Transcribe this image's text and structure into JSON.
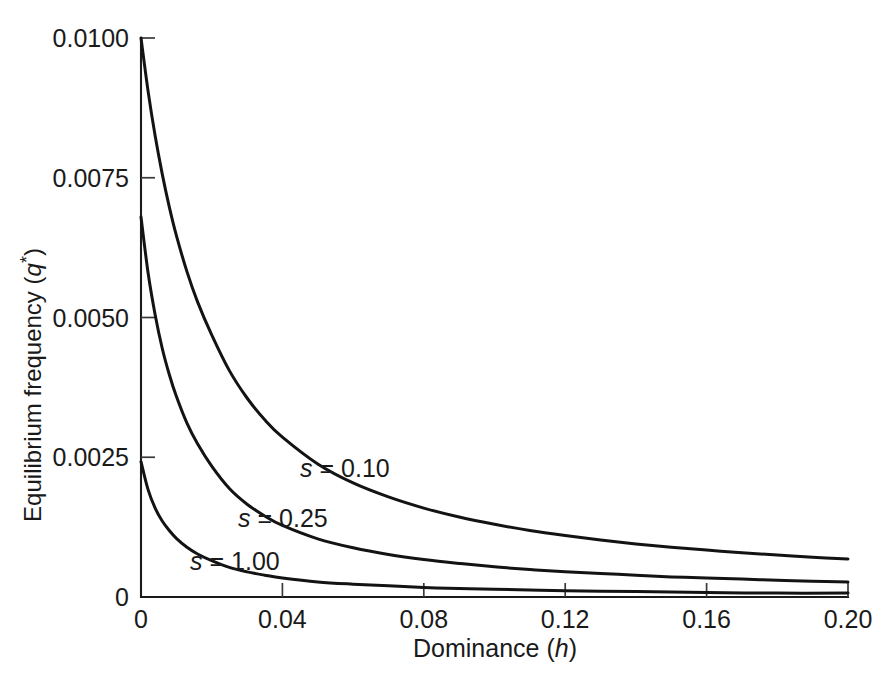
{
  "chart_data": {
    "type": "line",
    "title": "",
    "subtitle": "",
    "xlabel": "Dominance (h)",
    "xlabel_text": "Dominance (",
    "xlabel_var": "h",
    "xlabel_tail": ")",
    "ylabel": "Equilibrium frequency (q*)",
    "ylabel_text": "Equilibrium frequency (",
    "ylabel_var": "q",
    "ylabel_sup": "*",
    "ylabel_tail": ")",
    "xlim": [
      0,
      0.2
    ],
    "ylim": [
      0,
      0.01
    ],
    "grid": false,
    "legend_position": "inline-annotations",
    "xticks": [
      0,
      0.04,
      0.08,
      0.12,
      0.16,
      0.2
    ],
    "xtick_labels": [
      "0",
      "0.04",
      "0.08",
      "0.12",
      "0.16",
      "0.20"
    ],
    "yticks": [
      0,
      0.0025,
      0.005,
      0.0075,
      0.01
    ],
    "ytick_labels": [
      "0",
      "0.0025",
      "0.0050",
      "0.0075",
      "0.0100"
    ],
    "series": [
      {
        "name": "s = 0.10",
        "label_var": "s",
        "label_value": "= 0.10",
        "s": 0.1,
        "x": [
          0.0,
          0.002,
          0.004,
          0.006,
          0.008,
          0.01,
          0.013,
          0.016,
          0.02,
          0.025,
          0.03,
          0.035,
          0.04,
          0.05,
          0.06,
          0.07,
          0.08,
          0.09,
          0.1,
          0.11,
          0.12,
          0.13,
          0.14,
          0.15,
          0.16,
          0.17,
          0.18,
          0.19,
          0.2
        ],
        "y": [
          0.01,
          0.00905,
          0.00825,
          0.00757,
          0.00698,
          0.00647,
          0.00582,
          0.00528,
          0.00469,
          0.00405,
          0.00356,
          0.00317,
          0.00286,
          0.00238,
          0.00204,
          0.00179,
          0.00159,
          0.00143,
          0.0013,
          0.00119,
          0.0011,
          0.00102,
          0.00095,
          0.00089,
          0.00084,
          0.00079,
          0.00075,
          0.00071,
          0.00068
        ]
      },
      {
        "name": "s = 0.25",
        "label_var": "s",
        "label_value": "= 0.25",
        "s": 0.25,
        "x": [
          0.0,
          0.002,
          0.004,
          0.006,
          0.008,
          0.01,
          0.013,
          0.016,
          0.02,
          0.025,
          0.03,
          0.035,
          0.04,
          0.05,
          0.06,
          0.07,
          0.08,
          0.09,
          0.1,
          0.11,
          0.12,
          0.13,
          0.14,
          0.15,
          0.16,
          0.17,
          0.18,
          0.19,
          0.2
        ],
        "y": [
          0.0068,
          0.0058,
          0.00505,
          0.00445,
          0.00398,
          0.00359,
          0.00311,
          0.00274,
          0.00234,
          0.00194,
          0.00166,
          0.00145,
          0.00128,
          0.00104,
          0.00088,
          0.00076,
          0.00067,
          0.0006,
          0.00054,
          0.00049,
          0.00045,
          0.00042,
          0.00039,
          0.00036,
          0.00034,
          0.00032,
          0.0003,
          0.00028,
          0.00027
        ]
      },
      {
        "name": "s = 1.00",
        "label_var": "s",
        "label_value": "= 1.00",
        "s": 1.0,
        "x": [
          0.0,
          0.002,
          0.004,
          0.006,
          0.008,
          0.01,
          0.013,
          0.016,
          0.02,
          0.025,
          0.03,
          0.035,
          0.04,
          0.05,
          0.06,
          0.07,
          0.08,
          0.09,
          0.1,
          0.12,
          0.14,
          0.16,
          0.18,
          0.2
        ],
        "y": [
          0.00242,
          0.00192,
          0.00159,
          0.00136,
          0.00119,
          0.00105,
          0.00089,
          0.00077,
          0.00065,
          0.00053,
          0.00045,
          0.00039,
          0.00034,
          0.00027,
          0.00023,
          0.0002,
          0.00017,
          0.00015,
          0.00014,
          0.00011,
          0.0001,
          8e-05,
          7e-05,
          7e-05
        ]
      }
    ],
    "annotations": [
      {
        "text": "s = 0.10",
        "x_px": 300,
        "y_px": 477
      },
      {
        "text": "s = 0.25",
        "x_px": 238,
        "y_px": 527
      },
      {
        "text": "s = 1.00",
        "x_px": 190,
        "y_px": 570
      }
    ],
    "colors": {
      "curve": "#131313",
      "axis": "#1a1a1a",
      "background": "#ffffff"
    }
  }
}
